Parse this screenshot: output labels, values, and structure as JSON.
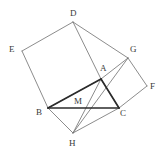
{
  "figure": {
    "width": 166,
    "height": 158,
    "background_color": "#ffffff",
    "thin_stroke_color": "#6e6e6e",
    "bold_stroke_color": "#2b2b2b",
    "label_color": "#3a3a3a",
    "points": [
      {
        "id": "D",
        "label": "D",
        "x": 73,
        "y": 22,
        "label_x": 70,
        "label_y": 9
      },
      {
        "id": "E",
        "label": "E",
        "x": 22,
        "y": 51,
        "label_x": 9,
        "label_y": 45
      },
      {
        "id": "G",
        "label": "G",
        "x": 128,
        "y": 58,
        "label_x": 130,
        "label_y": 45
      },
      {
        "id": "A",
        "label": "A",
        "x": 101,
        "y": 79,
        "label_x": 100,
        "label_y": 64
      },
      {
        "id": "F",
        "label": "F",
        "x": 147,
        "y": 86,
        "label_x": 150,
        "label_y": 82
      },
      {
        "id": "B",
        "label": "B",
        "x": 48,
        "y": 108,
        "label_x": 36,
        "label_y": 108
      },
      {
        "id": "M",
        "label": "M",
        "x": 79,
        "y": 108,
        "label_x": 74,
        "label_y": 97
      },
      {
        "id": "C",
        "label": "C",
        "x": 119,
        "y": 108,
        "label_x": 120,
        "label_y": 109
      },
      {
        "id": "H",
        "label": "H",
        "x": 73,
        "y": 133,
        "label_x": 69,
        "label_y": 139
      }
    ],
    "bold_segments": [
      {
        "name": "segment-A-B",
        "from": "A",
        "to": "B"
      },
      {
        "name": "segment-A-C",
        "from": "A",
        "to": "C"
      },
      {
        "name": "segment-B-C",
        "from": "B",
        "to": "C"
      }
    ],
    "thin_segments": [
      {
        "name": "segment-E-D",
        "from": "E",
        "to": "D"
      },
      {
        "name": "segment-D-A",
        "from": "D",
        "to": "A"
      },
      {
        "name": "segment-A-B-square",
        "from": "A",
        "to": "B"
      },
      {
        "name": "segment-B-E",
        "from": "B",
        "to": "E"
      },
      {
        "name": "segment-A-G",
        "from": "A",
        "to": "G"
      },
      {
        "name": "segment-G-F",
        "from": "G",
        "to": "F"
      },
      {
        "name": "segment-F-C",
        "from": "F",
        "to": "C"
      },
      {
        "name": "segment-C-A-square",
        "from": "C",
        "to": "A"
      },
      {
        "name": "segment-D-G",
        "from": "D",
        "to": "G"
      },
      {
        "name": "segment-B-H",
        "from": "B",
        "to": "H"
      },
      {
        "name": "segment-H-C",
        "from": "H",
        "to": "C"
      },
      {
        "name": "segment-A-H",
        "from": "A",
        "to": "H"
      },
      {
        "name": "segment-H-G-extension",
        "from": "H",
        "to": "G"
      }
    ]
  }
}
